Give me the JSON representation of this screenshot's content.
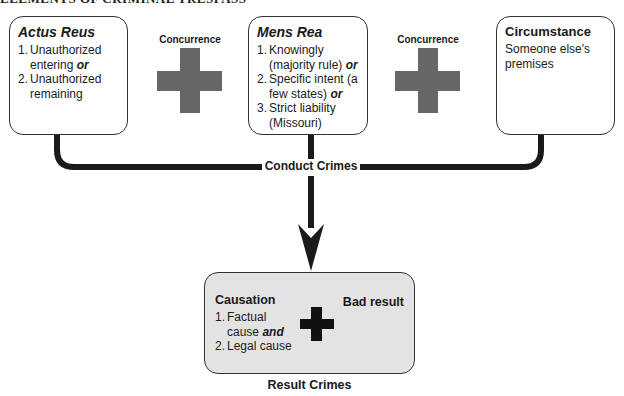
{
  "header": {
    "title": "ELEMENTS OF CRIMINAL TRESPASS"
  },
  "boxes": {
    "actus_reus": {
      "title": "Actus Reus",
      "items": [
        {
          "num": "1.",
          "text": "Unauthorized entering",
          "conj": "or"
        },
        {
          "num": "2.",
          "text": "Unauthorized remaining",
          "conj": ""
        }
      ]
    },
    "mens_rea": {
      "title": "Mens Rea",
      "items": [
        {
          "num": "1.",
          "text": "Knowingly (majority rule)",
          "conj": "or"
        },
        {
          "num": "2.",
          "text": "Specific intent (a few states)",
          "conj": "or"
        },
        {
          "num": "3.",
          "text": "Strict liability (Missouri)",
          "conj": ""
        }
      ]
    },
    "circumstance": {
      "title": "Circumstance",
      "text": "Someone else's premises"
    },
    "result": {
      "causation_title": "Causation",
      "items": [
        {
          "num": "1.",
          "text": "Factual cause",
          "conj": "and"
        },
        {
          "num": "2.",
          "text": "Legal cause",
          "conj": ""
        }
      ],
      "bad_result": "Bad result"
    }
  },
  "connectors": {
    "concurrence_1": "Concurrence",
    "concurrence_2": "Concurrence",
    "conduct_crimes": "Conduct Crimes",
    "result_crimes": "Result Crimes"
  },
  "colors": {
    "cross_gray": "#666666",
    "result_fill": "#e3e3e3",
    "line": "#1a1a1a"
  }
}
